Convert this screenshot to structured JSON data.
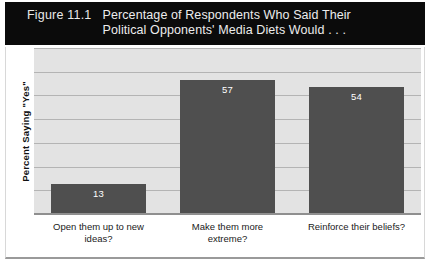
{
  "figure": {
    "number": "Figure 11.1",
    "title_line_1": "Percentage of Respondents Who Said Their",
    "title_line_2": "Political Opponents' Media Diets Would . . .",
    "header_background": "#0b0b0b",
    "header_text_color": "#ededed"
  },
  "chart_data": {
    "type": "bar",
    "title": "Figure 11.1  Percentage of Respondents Who Said Their Political Opponents' Media Diets Would . . .",
    "categories": [
      "Open them up to new ideas?",
      "Make them more extreme?",
      "Reinforce their beliefs?"
    ],
    "category_lines": [
      [
        "Open them up to new",
        "ideas?"
      ],
      [
        "Make them more",
        "extreme?"
      ],
      [
        "Reinforce their beliefs?"
      ]
    ],
    "values": [
      13,
      57,
      54
    ],
    "value_labels": [
      "13",
      "57",
      "54"
    ],
    "xlabel": "",
    "ylabel": "Percent Saying \"Yes\"",
    "ylim": [
      0,
      70
    ],
    "grid": true,
    "gridline_values": [
      10,
      20,
      30,
      40,
      50,
      60,
      70
    ],
    "tick_labels": [],
    "legend": null,
    "bar_color": "#4f4f4f",
    "value_label_color": "#ffffff",
    "plot_background": "#e3e3e3",
    "gridline_color": "#b4b4b4"
  }
}
